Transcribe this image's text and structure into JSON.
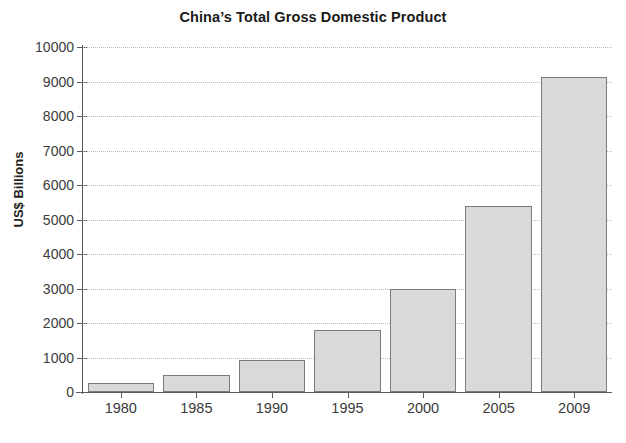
{
  "chart_data": {
    "type": "bar",
    "title": "China’s Total Gross Domestic Product",
    "xlabel": "",
    "ylabel": "US$ Billions",
    "categories": [
      "1980",
      "1985",
      "1990",
      "1995",
      "2000",
      "2005",
      "2009"
    ],
    "values": [
      250,
      500,
      920,
      1800,
      3000,
      5400,
      9120
    ],
    "ylim": [
      0,
      10000
    ],
    "ytick_labels": [
      "0",
      "1000",
      "2000",
      "3000",
      "4000",
      "5000",
      "6000",
      "7000",
      "8000",
      "9000",
      "10000"
    ],
    "ytick_values": [
      0,
      1000,
      2000,
      3000,
      4000,
      5000,
      6000,
      7000,
      8000,
      9000,
      10000
    ],
    "grid": true,
    "legend": "none",
    "series": [
      {
        "name": "Total GDP",
        "values": [
          250,
          500,
          920,
          1800,
          3000,
          5400,
          9120
        ]
      }
    ],
    "colors": {
      "bar_fill": "#d9d9d9",
      "bar_border": "#7c7c7c",
      "axis": "#58595b",
      "grid": "#b9b9b9",
      "text": "#231f20",
      "background": "#ffffff"
    }
  }
}
